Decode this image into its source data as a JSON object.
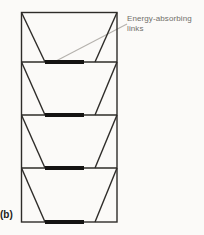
{
  "figure": {
    "panel_label": "(b)",
    "annotation": {
      "line1": "Energy-absorbing",
      "line2": "links"
    },
    "links_count": 4,
    "colors": {
      "background": "#fbfaf8",
      "line": "#2e2c29",
      "link-bar": "#141312",
      "leader": "#b5b2ad",
      "text": "#716f6a",
      "label": "#1c1b19"
    }
  }
}
